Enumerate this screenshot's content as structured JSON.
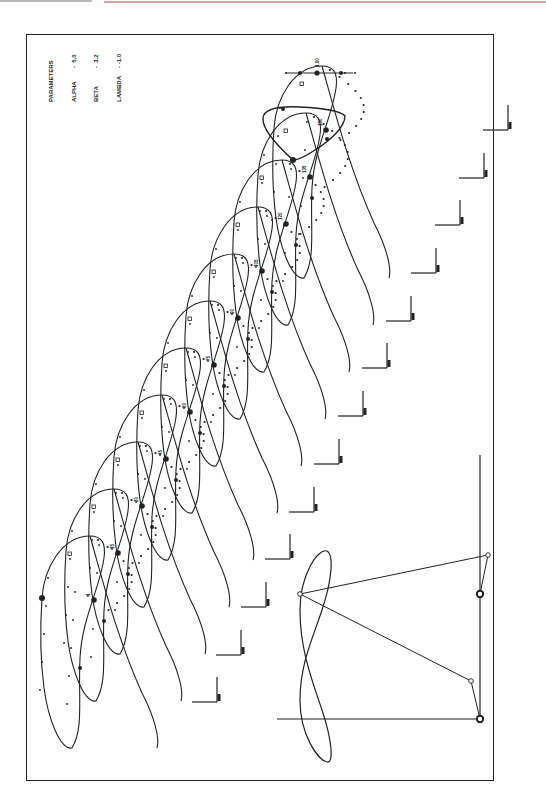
{
  "document": {
    "type": "mechanism-coupler-curve-plot"
  },
  "parameters": {
    "title": "PARAMETERS",
    "rows": [
      {
        "name": "ALPHA",
        "sep": "-",
        "value": "5.0"
      },
      {
        "name": "BETA",
        "sep": "-",
        "value": "3.2"
      },
      {
        "name": "LAMBDA",
        "sep": "-",
        "value": "-1.0"
      }
    ]
  },
  "colors": {
    "ink": "#222222",
    "background": "#ffffff",
    "top_rule_gray": "#b9b9b9",
    "top_rule_red": "#d9a3a3"
  },
  "frame": {
    "x": 26,
    "y": 34,
    "w": 468,
    "h": 747
  },
  "scale_bar": {
    "y": 73,
    "x1": 286,
    "x2": 353,
    "ticks": [
      286,
      300,
      317,
      345,
      355
    ],
    "big_marks": [
      300,
      317,
      341
    ],
    "label": "1.00"
  },
  "loops": {
    "base_anchor": [
      42,
      598
    ],
    "offsets": [
      [
        0,
        0
      ],
      [
        24,
        -47
      ],
      [
        48,
        -94
      ],
      [
        72,
        -141
      ],
      [
        96,
        -188
      ],
      [
        120,
        -235
      ],
      [
        144,
        -282
      ],
      [
        168,
        -329
      ],
      [
        192,
        -376
      ],
      [
        216,
        -423
      ],
      [
        232,
        -470
      ]
    ],
    "labels": [
      "1",
      "15",
      "30",
      "45",
      "60",
      "75",
      "90",
      "105",
      "120",
      "135",
      "150"
    ]
  },
  "top_loop": {
    "points": "M293,160 C282,150 262,130 263,118 C264,108 280,106 300,107 C320,108 340,110 345,116 C345,128 328,142 315,150 C306,156 298,160 293,160"
  },
  "axis_marks": {
    "positions": [
      [
        217,
        702
      ],
      [
        241,
        655
      ],
      [
        266,
        607
      ],
      [
        290,
        559
      ],
      [
        314,
        512
      ],
      [
        339,
        464
      ],
      [
        363,
        416
      ],
      [
        387,
        368
      ],
      [
        411,
        321
      ],
      [
        436,
        273
      ],
      [
        460,
        225
      ],
      [
        484,
        178
      ],
      [
        508,
        130
      ]
    ],
    "arm_length_h": 25,
    "arm_length_v": 25
  },
  "mechanism": {
    "ground_vertical": {
      "x": 480,
      "y1": 455,
      "y2": 720
    },
    "ground_horizontal": {
      "y": 719,
      "x1": 277,
      "x2": 480
    },
    "pivots": [
      [
        480,
        594
      ],
      [
        480,
        719
      ]
    ],
    "crank_ends": [
      [
        488,
        555
      ],
      [
        471,
        681
      ]
    ],
    "coupler_point": [
      300,
      594
    ],
    "coupler_curve": "M327,551 C334,555 332,580 322,610 C312,640 300,665 300,700 C300,735 318,760 327,762 C334,764 332,740 322,710 C312,680 300,650 300,610 C300,575 318,548 327,551 Z"
  }
}
